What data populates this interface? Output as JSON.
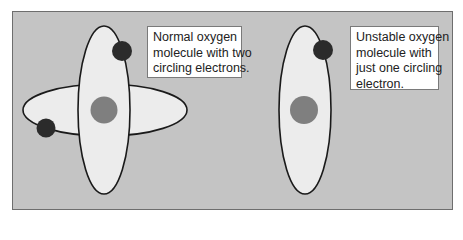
{
  "figure": {
    "colors": {
      "background": "#c4c4c4",
      "panel_border": "#6e6e6e",
      "orbit_fill": "#ececec",
      "orbit_stroke": "#1a1a1a",
      "nucleus": "#7f7f7f",
      "electron": "#2b2b2b",
      "label_background": "#ffffff"
    },
    "normal_molecule": {
      "orbit_count": 2,
      "electron_count": 2,
      "label_lines": [
        "Normal oxygen",
        "molecule with two",
        "circling electrons."
      ]
    },
    "unstable_molecule": {
      "orbit_count": 1,
      "electron_count": 1,
      "label_lines": [
        "Unstable oxygen",
        "molecule with",
        "just one circling",
        "electron."
      ]
    }
  }
}
